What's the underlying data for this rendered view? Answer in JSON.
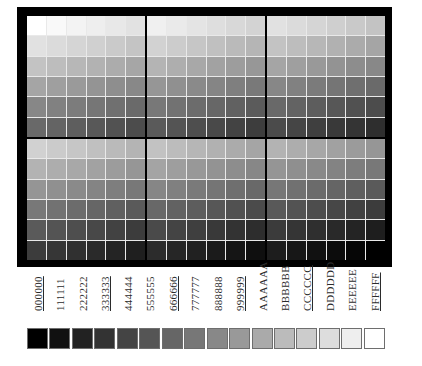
{
  "figure": {
    "frame_color": "#000000",
    "gridline_color": "#e9e9e9",
    "panels": [
      {
        "position": "top-left",
        "gray_levels": [
          [
            255,
            249,
            243,
            238,
            232,
            226
          ],
          [
            225,
            219,
            213,
            208,
            202,
            196
          ],
          [
            195,
            189,
            183,
            178,
            172,
            166
          ],
          [
            165,
            159,
            154,
            148,
            142,
            136
          ],
          [
            135,
            129,
            124,
            118,
            112,
            106
          ],
          [
            105,
            100,
            94,
            88,
            82,
            76
          ]
        ]
      },
      {
        "position": "top-middle",
        "gray_levels": [
          [
            240,
            234,
            228,
            222,
            216,
            211
          ],
          [
            210,
            204,
            198,
            192,
            186,
            181
          ],
          [
            180,
            174,
            168,
            162,
            157,
            151
          ],
          [
            150,
            144,
            138,
            133,
            127,
            121
          ],
          [
            120,
            114,
            108,
            103,
            97,
            91
          ],
          [
            90,
            84,
            78,
            73,
            67,
            61
          ]
        ]
      },
      {
        "position": "top-right",
        "gray_levels": [
          [
            225,
            219,
            213,
            207,
            201,
            195
          ],
          [
            195,
            189,
            183,
            177,
            171,
            165
          ],
          [
            165,
            159,
            153,
            147,
            141,
            136
          ],
          [
            135,
            129,
            123,
            117,
            111,
            106
          ],
          [
            105,
            99,
            93,
            87,
            81,
            76
          ],
          [
            75,
            69,
            63,
            57,
            52,
            46
          ]
        ]
      },
      {
        "position": "bottom-left",
        "gray_levels": [
          [
            209,
            203,
            198,
            192,
            186,
            180
          ],
          [
            179,
            173,
            168,
            162,
            156,
            150
          ],
          [
            149,
            144,
            138,
            132,
            126,
            120
          ],
          [
            120,
            114,
            108,
            102,
            96,
            90
          ],
          [
            90,
            84,
            78,
            72,
            66,
            60
          ],
          [
            60,
            54,
            48,
            42,
            36,
            31
          ]
        ]
      },
      {
        "position": "bottom-middle",
        "gray_levels": [
          [
            194,
            188,
            182,
            177,
            171,
            165
          ],
          [
            164,
            158,
            152,
            147,
            141,
            135
          ],
          [
            134,
            128,
            122,
            117,
            111,
            105
          ],
          [
            104,
            98,
            93,
            87,
            81,
            75
          ],
          [
            74,
            68,
            63,
            57,
            51,
            45
          ],
          [
            44,
            38,
            33,
            27,
            21,
            15
          ]
        ]
      },
      {
        "position": "bottom-right",
        "gray_levels": [
          [
            179,
            173,
            167,
            161,
            155,
            150
          ],
          [
            149,
            143,
            137,
            131,
            125,
            120
          ],
          [
            119,
            113,
            107,
            101,
            95,
            90
          ],
          [
            89,
            83,
            77,
            71,
            65,
            60
          ],
          [
            59,
            53,
            47,
            41,
            36,
            30
          ],
          [
            29,
            23,
            17,
            12,
            6,
            0
          ]
        ]
      }
    ]
  },
  "legend": {
    "items": [
      {
        "label": "000000",
        "color": "#000000",
        "underlined": true
      },
      {
        "label": "111111",
        "color": "#111111",
        "underlined": false
      },
      {
        "label": "222222",
        "color": "#222222",
        "underlined": false
      },
      {
        "label": "333333",
        "color": "#333333",
        "underlined": true
      },
      {
        "label": "444444",
        "color": "#444444",
        "underlined": false
      },
      {
        "label": "555555",
        "color": "#555555",
        "underlined": false
      },
      {
        "label": "666666",
        "color": "#666666",
        "underlined": true
      },
      {
        "label": "777777",
        "color": "#777777",
        "underlined": false
      },
      {
        "label": "888888",
        "color": "#888888",
        "underlined": false
      },
      {
        "label": "999999",
        "color": "#999999",
        "underlined": true
      },
      {
        "label": "AAAAAA",
        "color": "#AAAAAA",
        "underlined": false
      },
      {
        "label": "BBBBBB",
        "color": "#BBBBBB",
        "underlined": false
      },
      {
        "label": "CCCCCC",
        "color": "#CCCCCC",
        "underlined": true
      },
      {
        "label": "DDDDDD",
        "color": "#DDDDDD",
        "underlined": false
      },
      {
        "label": "EEEEEE",
        "color": "#EEEEEE",
        "underlined": false
      },
      {
        "label": "FFFFFF",
        "color": "#FFFFFF",
        "underlined": true
      }
    ]
  }
}
